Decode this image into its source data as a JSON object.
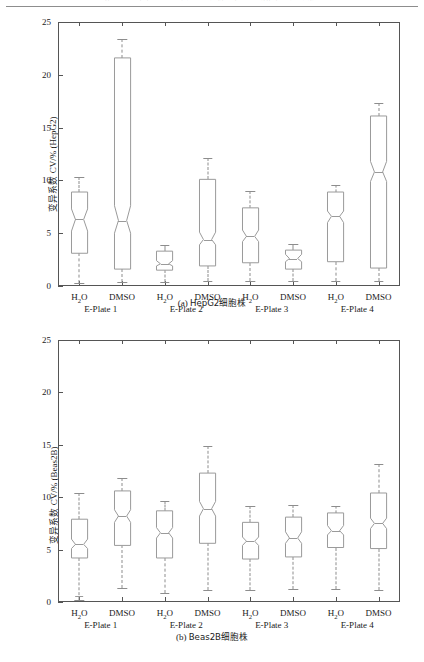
{
  "runhead": {
    "text": "第 3 期        张某某等：基于实时细胞分析技术的细胞活性检测方法研究"
  },
  "figure_a": {
    "id": "a",
    "caption_label": "(a)",
    "caption_text": "HepG2细胞株",
    "ylabel_prefix": "变异系数",
    "ylabel_suffix": " CV/% (HepG2)",
    "yticks": [
      0,
      5,
      10,
      15,
      20,
      25
    ],
    "ylim": [
      0,
      25
    ],
    "groups": [
      "E-Plate 1",
      "E-Plate 2",
      "E-Plate 3",
      "E-Plate 4"
    ],
    "conditions": [
      "H₂O",
      "DMSO"
    ]
  },
  "figure_b": {
    "id": "b",
    "caption_label": "(b)",
    "caption_text": "Beas2B细胞株",
    "ylabel_prefix": "变异系数",
    "ylabel_suffix": " CV/% (Beas2B)",
    "yticks": [
      0,
      5,
      10,
      15,
      20,
      25
    ],
    "ylim": [
      0,
      25
    ],
    "groups": [
      "E-Plate 1",
      "E-Plate 2",
      "E-Plate 3",
      "E-Plate 4"
    ],
    "conditions": [
      "H₂O",
      "DMSO"
    ]
  },
  "chart_data": [
    {
      "type": "box",
      "id": "a",
      "title": "(a) HepG2细胞株",
      "xlabel": "",
      "ylabel": "变异系数 CV/% (HepG2)",
      "ylim": [
        0,
        25
      ],
      "yticks": [
        0,
        5,
        10,
        15,
        20,
        25
      ],
      "grid": false,
      "legend": "none",
      "notched": true,
      "group_labels": [
        "E-Plate 1",
        "E-Plate 2",
        "E-Plate 3",
        "E-Plate 4"
      ],
      "boxes": [
        {
          "group": "E-Plate 1",
          "condition": "H₂O",
          "whisker_low": 0.3,
          "q1": 3.1,
          "notch_low": 5.2,
          "median": 6.3,
          "notch_high": 7.3,
          "q3": 8.9,
          "whisker_high": 10.3,
          "outliers": []
        },
        {
          "group": "E-Plate 1",
          "condition": "DMSO",
          "whisker_low": 0.4,
          "q1": 1.6,
          "notch_low": 5.0,
          "median": 6.2,
          "notch_high": 7.6,
          "q3": 21.6,
          "whisker_high": 23.4,
          "outliers": []
        },
        {
          "group": "E-Plate 2",
          "condition": "H₂O",
          "whisker_low": 0.4,
          "q1": 1.5,
          "notch_low": 1.9,
          "median": 2.1,
          "notch_high": 2.4,
          "q3": 3.3,
          "whisker_high": 3.9,
          "outliers": []
        },
        {
          "group": "E-Plate 2",
          "condition": "DMSO",
          "whisker_low": 0.5,
          "q1": 1.9,
          "notch_low": 3.9,
          "median": 4.4,
          "notch_high": 5.1,
          "q3": 10.1,
          "whisker_high": 12.1,
          "outliers": []
        },
        {
          "group": "E-Plate 3",
          "condition": "H₂O",
          "whisker_low": 0.5,
          "q1": 2.2,
          "notch_low": 4.2,
          "median": 4.7,
          "notch_high": 5.3,
          "q3": 7.4,
          "whisker_high": 9.0,
          "outliers": []
        },
        {
          "group": "E-Plate 3",
          "condition": "DMSO",
          "whisker_low": 0.5,
          "q1": 1.6,
          "notch_low": 2.3,
          "median": 2.6,
          "notch_high": 3.0,
          "q3": 3.4,
          "whisker_high": 4.0,
          "outliers": []
        },
        {
          "group": "E-Plate 4",
          "condition": "H₂O",
          "whisker_low": 0.5,
          "q1": 2.3,
          "notch_low": 6.0,
          "median": 6.6,
          "notch_high": 7.1,
          "q3": 8.9,
          "whisker_high": 9.6,
          "outliers": []
        },
        {
          "group": "E-Plate 4",
          "condition": "DMSO",
          "whisker_low": 0.5,
          "q1": 1.7,
          "notch_low": 9.9,
          "median": 10.8,
          "notch_high": 11.8,
          "q3": 16.1,
          "whisker_high": 17.3,
          "outliers": []
        }
      ]
    },
    {
      "type": "box",
      "id": "b",
      "title": "(b) Beas2B细胞株",
      "xlabel": "",
      "ylabel": "变异系数 CV/% (Beas2B)",
      "ylim": [
        0,
        25
      ],
      "yticks": [
        0,
        5,
        10,
        15,
        20,
        25
      ],
      "grid": false,
      "legend": "none",
      "notched": true,
      "group_labels": [
        "E-Plate 1",
        "E-Plate 2",
        "E-Plate 3",
        "E-Plate 4"
      ],
      "boxes": [
        {
          "group": "E-Plate 1",
          "condition": "H₂O",
          "whisker_low": 0.2,
          "q1": 4.2,
          "notch_low": 5.1,
          "median": 5.5,
          "notch_high": 6.0,
          "q3": 7.9,
          "whisker_high": 10.4,
          "outliers": [
            0.6
          ]
        },
        {
          "group": "E-Plate 1",
          "condition": "DMSO",
          "whisker_low": 1.3,
          "q1": 5.4,
          "notch_low": 7.6,
          "median": 8.2,
          "notch_high": 8.8,
          "q3": 10.6,
          "whisker_high": 11.8,
          "outliers": []
        },
        {
          "group": "E-Plate 2",
          "condition": "H₂O",
          "whisker_low": 0.9,
          "q1": 4.2,
          "notch_low": 6.1,
          "median": 6.6,
          "notch_high": 7.1,
          "q3": 8.7,
          "whisker_high": 9.6,
          "outliers": []
        },
        {
          "group": "E-Plate 2",
          "condition": "DMSO",
          "whisker_low": 1.1,
          "q1": 5.6,
          "notch_low": 8.2,
          "median": 8.9,
          "notch_high": 9.6,
          "q3": 12.3,
          "whisker_high": 14.9,
          "outliers": []
        },
        {
          "group": "E-Plate 3",
          "condition": "H₂O",
          "whisker_low": 1.1,
          "q1": 4.1,
          "notch_low": 5.4,
          "median": 5.8,
          "notch_high": 6.2,
          "q3": 7.6,
          "whisker_high": 9.2,
          "outliers": []
        },
        {
          "group": "E-Plate 3",
          "condition": "DMSO",
          "whisker_low": 1.2,
          "q1": 4.3,
          "notch_low": 5.6,
          "median": 6.1,
          "notch_high": 6.7,
          "q3": 8.1,
          "whisker_high": 9.3,
          "outliers": []
        },
        {
          "group": "E-Plate 4",
          "condition": "H₂O",
          "whisker_low": 1.2,
          "q1": 5.2,
          "notch_low": 6.4,
          "median": 6.8,
          "notch_high": 7.3,
          "q3": 8.5,
          "whisker_high": 9.2,
          "outliers": []
        },
        {
          "group": "E-Plate 4",
          "condition": "DMSO",
          "whisker_low": 1.1,
          "q1": 5.1,
          "notch_low": 7.0,
          "median": 7.5,
          "notch_high": 8.0,
          "q3": 10.4,
          "whisker_high": 13.2,
          "outliers": []
        }
      ]
    }
  ]
}
